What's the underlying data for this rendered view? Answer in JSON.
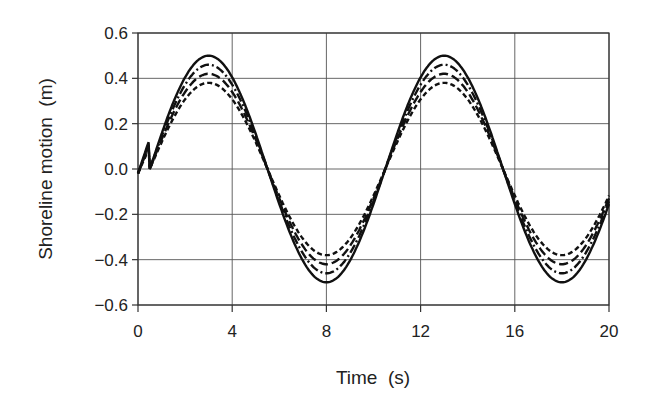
{
  "chart_data": {
    "type": "line",
    "title": "",
    "xlabel": "Time  (s)",
    "ylabel": "Shoreline motion  (m)",
    "xlim": [
      0,
      20
    ],
    "ylim": [
      -0.6,
      0.6
    ],
    "xticks": [
      0,
      4,
      8,
      12,
      16,
      20
    ],
    "yticks": [
      0.6,
      0.4,
      0.2,
      0.0,
      -0.2,
      -0.4,
      -0.6
    ],
    "xtick_labels": [
      "0",
      "4",
      "8",
      "12",
      "16",
      "20"
    ],
    "ytick_labels": [
      "0.6",
      "0.4",
      "0.2",
      "0.0",
      "−0.2",
      "−0.4",
      "−0.6"
    ],
    "grid": true,
    "legend": null,
    "period_s": 10,
    "phase_zero_crossing_s": 0.5,
    "series": [
      {
        "name": "solid",
        "style": "solid",
        "amplitude": 0.5,
        "peaks": [
          [
            3,
            0.5
          ],
          [
            13,
            0.5
          ]
        ],
        "troughs": [
          [
            8,
            -0.49
          ],
          [
            18,
            -0.49
          ]
        ]
      },
      {
        "name": "dash-dot",
        "style": "dashdot",
        "amplitude": 0.46,
        "peaks": [
          [
            3,
            0.46
          ],
          [
            13,
            0.46
          ]
        ],
        "troughs": [
          [
            8,
            -0.46
          ],
          [
            18,
            -0.46
          ]
        ]
      },
      {
        "name": "long-dash",
        "style": "longdash",
        "amplitude": 0.42,
        "peaks": [
          [
            3,
            0.42
          ],
          [
            13,
            0.42
          ]
        ],
        "troughs": [
          [
            8,
            -0.43
          ],
          [
            18,
            -0.43
          ]
        ]
      },
      {
        "name": "short-dash",
        "style": "shortdash",
        "amplitude": 0.38,
        "peaks": [
          [
            3,
            0.38
          ],
          [
            13,
            0.38
          ]
        ],
        "troughs": [
          [
            8,
            -0.4
          ],
          [
            18,
            -0.4
          ]
        ]
      }
    ]
  }
}
